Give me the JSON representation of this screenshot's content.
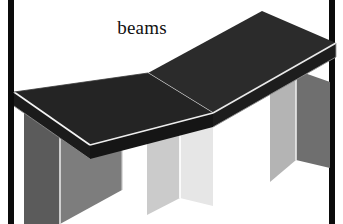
{
  "figure": {
    "caption": "beams",
    "background_color": "#ffffff",
    "frame_color": "#0b0b0b",
    "frame": {
      "left_rule": true,
      "right_rule": true,
      "top_rule": false,
      "bottom_rule": false
    }
  },
  "scene": {
    "description": "Isometric line drawing of two dark rectangular beams resting end to end on three lighter rectangular block supports",
    "object_count": 5,
    "beams": [
      {
        "name": "left-beam",
        "top_face_color": "#232323",
        "front_face_color": "#1a1a1a",
        "edge_highlight_color": "#f2f2f2"
      },
      {
        "name": "right-beam",
        "top_face_color": "#2b2b2b",
        "front_face_color": "#1f1f1f",
        "edge_highlight_color": "#ededed"
      }
    ],
    "supports": [
      {
        "name": "left-support",
        "left_face_color": "#5a5a5a",
        "right_face_color": "#7b7b7b",
        "edge_highlight_color": "#d8d8d8"
      },
      {
        "name": "center-support",
        "left_face_color": "#c9c9c9",
        "right_face_color": "#e4e4e4",
        "edge_highlight_color": "#fdfdfd"
      },
      {
        "name": "right-support",
        "left_face_color": "#b2b2b2",
        "right_face_color": "#6e6e6e",
        "edge_highlight_color": "#e8e8e8"
      }
    ]
  }
}
